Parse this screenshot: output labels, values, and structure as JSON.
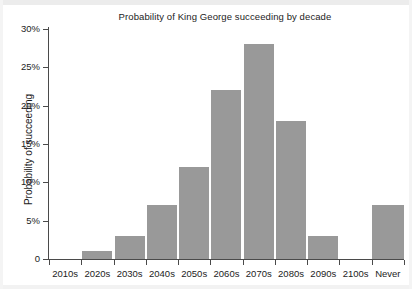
{
  "chart_data": {
    "type": "bar",
    "title": "Probability of King George succeeding by decade",
    "xlabel": "",
    "ylabel": "Probability of succeeding",
    "categories": [
      "2010s",
      "2020s",
      "2030s",
      "2040s",
      "2050s",
      "2060s",
      "2070s",
      "2080s",
      "2090s",
      "2100s",
      "Never"
    ],
    "values": [
      0,
      1,
      3,
      7,
      12,
      22,
      28,
      18,
      3,
      0,
      7
    ],
    "ylim": [
      0,
      30
    ],
    "yticks": [
      0,
      5,
      10,
      15,
      20,
      25,
      30
    ],
    "ytick_labels": [
      "0",
      "5%",
      "10%",
      "15%",
      "20%",
      "25%",
      "30%"
    ],
    "grid": false,
    "legend": "none",
    "units": "percent",
    "bar_color": "#999999",
    "axis_color": "#4a4a4a",
    "text_color": "#1c1c1c",
    "background": "#ffffff"
  }
}
